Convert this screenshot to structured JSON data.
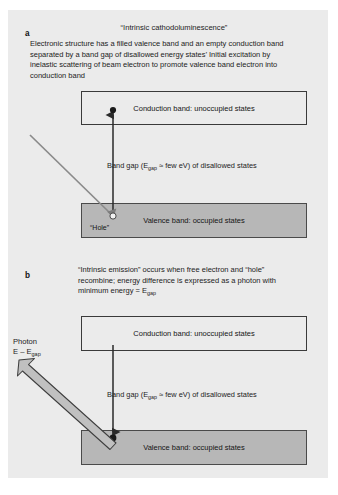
{
  "figure": {
    "background_color": "#ffffff",
    "panel_color": "#ebebeb"
  },
  "colors": {
    "band_fill_conduction": "#ebebeb",
    "band_fill_valence": "#b7b7b7",
    "band_border": "#3a3a3a",
    "arrow_black": "#2a2a2a",
    "arrow_gray": "#8a8a8a",
    "photon_arrow_fill": "#bdbdbd",
    "text": "#1c1c1c"
  },
  "panel_a": {
    "letter": "a",
    "title": "“Intrinsic cathodoluminescence”",
    "description": "Electronic structure has a filled valence band and an empty conduction band separated by a band gap of disallowed energy states’ Initial excitation by inelastic scattering of beam electron to promote valence band electron into conduction band",
    "conduction_band_label": "Conduction band: unoccupied states",
    "band_gap_label_pre": "Band gap (E",
    "band_gap_label_sub": "gap",
    "band_gap_label_post": " ≈ few eV) of disallowed states",
    "valence_band_label": "Valence band: occupied states",
    "hole_label": "“Hole”"
  },
  "panel_b": {
    "letter": "b",
    "description": "“Intrinsic emission” occurs when free electron and “hole” recombine; energy difference is expressed as a photon with minimum energy = E",
    "description_sub": "gap",
    "conduction_band_label": "Conduction band: unoccupied states",
    "band_gap_label_pre": "Band gap (E",
    "band_gap_label_sub": "gap",
    "band_gap_label_post": " ≈ few eV) of disallowed states",
    "valence_band_label": "Valence band: occupied states",
    "photon_label_line1": "Photon",
    "photon_label_line2_pre": "E – E",
    "photon_label_line2_sub": "gap"
  },
  "icons": {
    "electron_dot": "filled-circle",
    "hole_circle": "open-circle",
    "excitation_arrow": "up-arrow",
    "beam_arrow": "diagonal-down-right-arrow",
    "recombination_arrow": "down-arrow",
    "photon_arrow": "block-arrow-up-left"
  }
}
